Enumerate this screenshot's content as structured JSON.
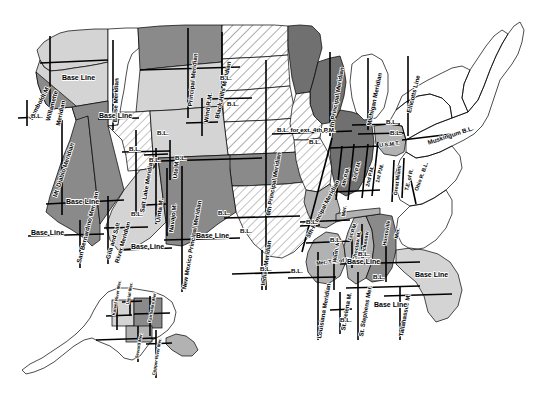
{
  "map": {
    "title": "Principal Meridians and Base Lines of the United States Public Land Survey System",
    "type": "historical-reference-map",
    "background_color": "#ffffff",
    "line_color": "#000000",
    "fills": {
      "light_gray": "#d4d4d4",
      "mid_gray": "#b2b2b2",
      "dark_gray": "#8a8a8a",
      "darker_gray": "#707070",
      "white": "#ffffff",
      "hatch": "#e8e8e8"
    }
  },
  "labels": {
    "meridians": [
      {
        "id": "humboldt",
        "text": "Humboldt M.",
        "x": 28,
        "y": 118,
        "rot": -62,
        "size": "s6"
      },
      {
        "id": "willamette",
        "text": "Willamette",
        "x": 45,
        "y": 120,
        "rot": -75,
        "size": "s6"
      },
      {
        "id": "willamette-mer",
        "text": "Meridian",
        "x": 55,
        "y": 125,
        "rot": -78,
        "size": "s6"
      },
      {
        "id": "mt-diablo",
        "text": "Mt. Diablo Meridian",
        "x": 52,
        "y": 196,
        "rot": -72,
        "size": "s6"
      },
      {
        "id": "san-bernardino",
        "text": "San Bernardino Meridian",
        "x": 76,
        "y": 262,
        "rot": -76,
        "size": "s6"
      },
      {
        "id": "boise",
        "text": "Boise Meridian",
        "x": 112,
        "y": 122,
        "rot": -88,
        "size": "s6"
      },
      {
        "id": "gila-salt-1",
        "text": "Gila and Salt",
        "x": 105,
        "y": 258,
        "rot": -74,
        "size": "s6"
      },
      {
        "id": "gila-salt-2",
        "text": "River Meridian",
        "x": 114,
        "y": 262,
        "rot": -74,
        "size": "s6"
      },
      {
        "id": "salt-lake",
        "text": "Salt Lake Meridian",
        "x": 139,
        "y": 212,
        "rot": -80,
        "size": "s6"
      },
      {
        "id": "uinta",
        "text": "Uinta M.",
        "x": 155,
        "y": 222,
        "rot": -82,
        "size": "s6"
      },
      {
        "id": "ute",
        "text": "Ute M.",
        "x": 172,
        "y": 178,
        "rot": -84,
        "size": "s6"
      },
      {
        "id": "navajo",
        "text": "Navajo M.",
        "x": 168,
        "y": 232,
        "rot": -83,
        "size": "s6"
      },
      {
        "id": "new-mexico",
        "text": "New Mexico Principal Meridian",
        "x": 181,
        "y": 289,
        "rot": -80,
        "size": "s6"
      },
      {
        "id": "principal-mt",
        "text": "Principal Meridian",
        "x": 187,
        "y": 106,
        "rot": -84,
        "size": "s6"
      },
      {
        "id": "wind-river",
        "text": "Wind R.M.",
        "x": 203,
        "y": 122,
        "rot": -82,
        "size": "s6"
      },
      {
        "id": "black-hills",
        "text": "Black Hills Meridian",
        "x": 214,
        "y": 118,
        "rot": -78,
        "size": "s6"
      },
      {
        "id": "sixth-pm",
        "text": "6th Principal Meridian",
        "x": 265,
        "y": 215,
        "rot": -80,
        "size": "s6"
      },
      {
        "id": "indian-mer",
        "text": "Indian Meridian",
        "x": 260,
        "y": 285,
        "rot": -82,
        "size": "s6"
      },
      {
        "id": "fifth-pm",
        "text": "5th Principal Meridian",
        "x": 305,
        "y": 236,
        "rot": -62,
        "size": "s6"
      },
      {
        "id": "fourth-pm-ext",
        "text": "4th Principal Meridian",
        "x": 328,
        "y": 130,
        "rot": -80,
        "size": "s6"
      },
      {
        "id": "michigan-mer",
        "text": "Michigan Meridian",
        "x": 366,
        "y": 125,
        "rot": -78,
        "size": "s6"
      },
      {
        "id": "ellicotts",
        "text": "Ellicotts Line",
        "x": 406,
        "y": 112,
        "rot": -76,
        "size": "s6"
      },
      {
        "id": "fourth-pm-il",
        "text": "4th P.M.",
        "x": 341,
        "y": 186,
        "rot": -76,
        "size": "s5"
      },
      {
        "id": "third-pm",
        "text": "3rd P.M.",
        "x": 352,
        "y": 180,
        "rot": -76,
        "size": "s5"
      },
      {
        "id": "second-pm",
        "text": "2nd P.M.",
        "x": 365,
        "y": 186,
        "rot": -76,
        "size": "s5"
      },
      {
        "id": "first-pm",
        "text": "1st P.M.",
        "x": 375,
        "y": 182,
        "rot": -76,
        "size": "s5"
      },
      {
        "id": "first-pm-low",
        "text": "1st P.M.",
        "x": 347,
        "y": 240,
        "rot": -70,
        "size": "s5"
      },
      {
        "id": "usmt",
        "text": "U.S.M.T.",
        "x": 379,
        "y": 143,
        "rot": -6,
        "size": "s5"
      },
      {
        "id": "great-miami",
        "text": "Great Miami",
        "x": 393,
        "y": 195,
        "rot": -82,
        "size": "s5"
      },
      {
        "id": "te-of-r",
        "text": "T.E. of R.",
        "x": 404,
        "y": 190,
        "rot": -76,
        "size": "s5"
      },
      {
        "id": "ohio-r-bl",
        "text": "Ohio R. B.L.",
        "x": 414,
        "y": 190,
        "rot": -70,
        "size": "s5"
      },
      {
        "id": "muskingum-bl",
        "text": "Muskingum B.L.",
        "x": 427,
        "y": 140,
        "rot": -18,
        "size": "s6"
      },
      {
        "id": "mer-tn-of-r",
        "text": "Mer. T.N. of R.",
        "x": 316,
        "y": 261,
        "rot": -6,
        "size": "s5"
      },
      {
        "id": "mer-ar",
        "text": "Mer.",
        "x": 341,
        "y": 216,
        "rot": -82,
        "size": "s5"
      },
      {
        "id": "wash-m",
        "text": "Wash. M.",
        "x": 332,
        "y": 262,
        "rot": -80,
        "size": "s5"
      },
      {
        "id": "choctaw",
        "text": "Choctaw M.",
        "x": 352,
        "y": 260,
        "rot": -80,
        "size": "s5"
      },
      {
        "id": "chickasaw",
        "text": "Chickasaw",
        "x": 360,
        "y": 258,
        "rot": -80,
        "size": "s5"
      },
      {
        "id": "huntsville",
        "text": "Huntsville",
        "x": 382,
        "y": 245,
        "rot": -80,
        "size": "s5"
      },
      {
        "id": "huntsville-mer",
        "text": "Mer.",
        "x": 394,
        "y": 238,
        "rot": -80,
        "size": "s5"
      },
      {
        "id": "louisiana",
        "text": "Louisiana Meridian",
        "x": 316,
        "y": 338,
        "rot": -80,
        "size": "s6"
      },
      {
        "id": "st-helena",
        "text": "St. Helena M.",
        "x": 340,
        "y": 330,
        "rot": -80,
        "size": "s6"
      },
      {
        "id": "st-stephens",
        "text": "St. Stephens Mer.",
        "x": 358,
        "y": 336,
        "rot": -80,
        "size": "s6"
      },
      {
        "id": "tallahassee",
        "text": "Tallahassee M.",
        "x": 398,
        "y": 336,
        "rot": -80,
        "size": "s6"
      }
    ],
    "base_lines": [
      {
        "id": "bl-or",
        "text": "Base Line",
        "x": 62,
        "y": 74,
        "rot": 0,
        "size": "s7"
      },
      {
        "id": "bl-id",
        "text": "Base Line",
        "x": 99,
        "y": 112,
        "rot": 0,
        "size": "s7"
      },
      {
        "id": "bl-ca-n",
        "text": "B.L.",
        "x": 31,
        "y": 113,
        "rot": 0,
        "size": "s6"
      },
      {
        "id": "bl-ca-s",
        "text": "Base Line",
        "x": 66,
        "y": 198,
        "rot": 0,
        "size": "s7"
      },
      {
        "id": "bl-nv",
        "text": "B.L.",
        "x": 129,
        "y": 146,
        "rot": 0,
        "size": "s6"
      },
      {
        "id": "bl-ut",
        "text": "B.L.",
        "x": 149,
        "y": 157,
        "rot": 0,
        "size": "s6"
      },
      {
        "id": "bl-ute",
        "text": "B.L.",
        "x": 175,
        "y": 155,
        "rot": 0,
        "size": "s6"
      },
      {
        "id": "bl-az",
        "text": "B.L.",
        "x": 131,
        "y": 211,
        "rot": 0,
        "size": "s6"
      },
      {
        "id": "bl-az-s",
        "text": "Base Line",
        "x": 131,
        "y": 243,
        "rot": 0,
        "size": "s7"
      },
      {
        "id": "bl-ca-sb",
        "text": "Base Line",
        "x": 31,
        "y": 229,
        "rot": 0,
        "size": "s7"
      },
      {
        "id": "bl-nm",
        "text": "Base Line",
        "x": 196,
        "y": 232,
        "rot": 0,
        "size": "s7"
      },
      {
        "id": "bl-mt",
        "text": "B.L.",
        "x": 220,
        "y": 75,
        "rot": 0,
        "size": "s6"
      },
      {
        "id": "bl-wy",
        "text": "B.L.",
        "x": 157,
        "y": 130,
        "rot": 0,
        "size": "s6"
      },
      {
        "id": "bl-wy2",
        "text": "B.L.",
        "x": 227,
        "y": 101,
        "rot": 0,
        "size": "s6"
      },
      {
        "id": "bl-co",
        "text": "B.L.",
        "x": 218,
        "y": 210,
        "rot": 0,
        "size": "s6"
      },
      {
        "id": "bl-ks",
        "text": "B.L.",
        "x": 240,
        "y": 228,
        "rot": 0,
        "size": "s6"
      },
      {
        "id": "bl-ok",
        "text": "B.L.",
        "x": 260,
        "y": 266,
        "rot": 0,
        "size": "s6"
      },
      {
        "id": "bl-ext-4th",
        "text": "B.L. for ext. 4th P.M.",
        "x": 277,
        "y": 127,
        "rot": 0,
        "size": "s6"
      },
      {
        "id": "bl-ia",
        "text": "B.L.",
        "x": 309,
        "y": 139,
        "rot": 0,
        "size": "s6"
      },
      {
        "id": "bl-mi1",
        "text": "B.L.",
        "x": 386,
        "y": 119,
        "rot": 0,
        "size": "s6"
      },
      {
        "id": "bl-mi2",
        "text": "B.L.",
        "x": 390,
        "y": 130,
        "rot": 0,
        "size": "s6"
      },
      {
        "id": "bl-il",
        "text": "B.L.",
        "x": 358,
        "y": 251,
        "rot": 0,
        "size": "s6"
      },
      {
        "id": "bl-ar",
        "text": "B.L.",
        "x": 330,
        "y": 237,
        "rot": 0,
        "size": "s6"
      },
      {
        "id": "bl-ms",
        "text": "Base Line",
        "x": 347,
        "y": 258,
        "rot": 0,
        "size": "s7"
      },
      {
        "id": "bl-ms2",
        "text": "Base Line",
        "x": 374,
        "y": 301,
        "rot": 0,
        "size": "s7"
      },
      {
        "id": "bl-la",
        "text": "B.L.",
        "x": 340,
        "y": 317,
        "rot": 0,
        "size": "s6"
      },
      {
        "id": "bl-la2",
        "text": "B.L.",
        "x": 291,
        "y": 268,
        "rot": 0,
        "size": "s6"
      },
      {
        "id": "bl-al",
        "text": "B.L.",
        "x": 373,
        "y": 274,
        "rot": 0,
        "size": "s6"
      },
      {
        "id": "bl-fl",
        "text": "Base Line",
        "x": 415,
        "y": 271,
        "rot": 0,
        "size": "s7"
      },
      {
        "id": "bl-tx",
        "text": "B.L.",
        "x": 306,
        "y": 219,
        "rot": 0,
        "size": "s6"
      }
    ],
    "alaska": [
      {
        "id": "kateel-river",
        "text": "Kateel River Mer.",
        "x": 112,
        "y": 315,
        "rot": -80,
        "size": "s4"
      },
      {
        "id": "umiat",
        "text": "Umiat Mer.",
        "x": 126,
        "y": 304,
        "rot": -80,
        "size": "s4"
      },
      {
        "id": "fairbanks",
        "text": "Fairbanks Mer.",
        "x": 148,
        "y": 322,
        "rot": -80,
        "size": "s4"
      },
      {
        "id": "seward",
        "text": "Seward Mer.",
        "x": 135,
        "y": 358,
        "rot": -80,
        "size": "s4"
      },
      {
        "id": "copper-river",
        "text": "Copper River Mer.",
        "x": 152,
        "y": 375,
        "rot": -80,
        "size": "s4"
      }
    ]
  }
}
